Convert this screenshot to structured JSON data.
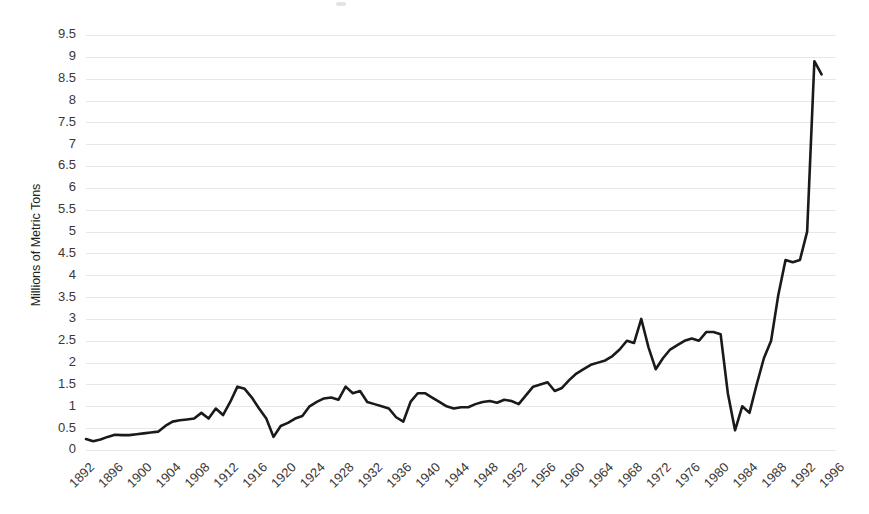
{
  "chart_data": {
    "type": "line",
    "title": "",
    "subtitle": "",
    "xlabel": "",
    "ylabel": "Millions of Metric Tons",
    "xlim": [
      1892,
      1996
    ],
    "ylim": [
      0,
      9.5
    ],
    "grid": true,
    "legend": false,
    "legend_position": "none",
    "line_color": "#1c1a19",
    "grid_color": "#e9e6e4",
    "y_ticks": [
      "0",
      "0.5",
      "1",
      "1.5",
      "2",
      "2.5",
      "3",
      "3.5",
      "4",
      "4.5",
      "5",
      "5.5",
      "6",
      "6.5",
      "7",
      "7.5",
      "8",
      "8.5",
      "9",
      "9.5"
    ],
    "y_tick_values": [
      0,
      0.5,
      1,
      1.5,
      2,
      2.5,
      3,
      3.5,
      4,
      4.5,
      5,
      5.5,
      6,
      6.5,
      7,
      7.5,
      8,
      8.5,
      9,
      9.5
    ],
    "x_ticks": [
      "1892",
      "1896",
      "1900",
      "1904",
      "1908",
      "1912",
      "1916",
      "1920",
      "1924",
      "1928",
      "1932",
      "1936",
      "1940",
      "1944",
      "1948",
      "1952",
      "1956",
      "1960",
      "1964",
      "1968",
      "1972",
      "1976",
      "1980",
      "1984",
      "1988",
      "1992",
      "1996"
    ],
    "x_tick_values": [
      1892,
      1896,
      1900,
      1904,
      1908,
      1912,
      1916,
      1920,
      1924,
      1928,
      1932,
      1936,
      1940,
      1944,
      1948,
      1952,
      1956,
      1960,
      1964,
      1968,
      1972,
      1976,
      1980,
      1984,
      1988,
      1992,
      1996
    ],
    "x_tick_rotation_deg": 45,
    "series": [
      {
        "name": "Production",
        "x": [
          1892,
          1893,
          1894,
          1895,
          1896,
          1897,
          1898,
          1899,
          1900,
          1901,
          1902,
          1903,
          1904,
          1905,
          1906,
          1907,
          1908,
          1909,
          1910,
          1911,
          1912,
          1913,
          1914,
          1915,
          1916,
          1917,
          1918,
          1919,
          1920,
          1921,
          1922,
          1923,
          1924,
          1925,
          1926,
          1927,
          1928,
          1929,
          1930,
          1931,
          1932,
          1933,
          1934,
          1935,
          1936,
          1937,
          1938,
          1939,
          1940,
          1941,
          1942,
          1943,
          1944,
          1945,
          1946,
          1947,
          1948,
          1949,
          1950,
          1951,
          1952,
          1953,
          1954,
          1955,
          1956,
          1957,
          1958,
          1959,
          1960,
          1961,
          1962,
          1963,
          1964,
          1965,
          1966,
          1967,
          1968,
          1969,
          1970,
          1971,
          1972,
          1973,
          1974,
          1975,
          1976,
          1977,
          1978,
          1979,
          1980,
          1981,
          1982,
          1983,
          1984,
          1985,
          1986,
          1987,
          1988,
          1989,
          1990,
          1991,
          1992,
          1993
        ],
        "values": [
          0.25,
          0.2,
          0.24,
          0.3,
          0.35,
          0.34,
          0.34,
          0.36,
          0.38,
          0.4,
          0.42,
          0.55,
          0.65,
          0.68,
          0.7,
          0.72,
          0.85,
          0.72,
          0.95,
          0.8,
          1.1,
          1.45,
          1.4,
          1.2,
          0.95,
          0.72,
          0.3,
          0.55,
          0.62,
          0.72,
          0.78,
          1.0,
          1.1,
          1.18,
          1.2,
          1.15,
          1.45,
          1.3,
          1.35,
          1.1,
          1.05,
          1.0,
          0.95,
          0.75,
          0.65,
          1.1,
          1.3,
          1.3,
          1.2,
          1.1,
          1.0,
          0.95,
          0.98,
          0.98,
          1.05,
          1.1,
          1.12,
          1.08,
          1.15,
          1.12,
          1.05,
          1.25,
          1.45,
          1.5,
          1.55,
          1.35,
          1.42,
          1.6,
          1.75,
          1.85,
          1.95,
          2.0,
          2.05,
          2.15,
          2.3,
          2.5,
          2.45,
          3.0,
          2.35,
          1.85,
          2.1,
          2.3,
          2.4,
          2.5,
          2.55,
          2.5,
          2.7,
          2.7,
          2.65,
          1.3,
          0.45,
          1.0,
          0.85,
          1.5,
          2.1,
          2.5,
          3.55,
          4.35,
          4.3,
          4.35,
          5.0,
          8.9
        ],
        "end_value": 8.6,
        "end_x": 1994
      }
    ],
    "annotations": [],
    "peak": {
      "x": 1993,
      "y": 8.9
    },
    "min": {
      "x": 1982,
      "y": 0.45
    }
  },
  "axis": {
    "y_title": "Millions of Metric Tons"
  }
}
